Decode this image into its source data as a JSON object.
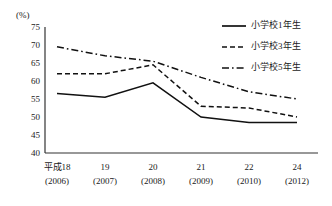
{
  "chart_data": {
    "type": "line",
    "title": "",
    "subtitle": "",
    "xlabel": "",
    "ylabel": "",
    "unit_label": "(%)",
    "ylim": [
      40,
      75
    ],
    "ytick_step": 5,
    "yticks": [
      "75",
      "70",
      "65",
      "60",
      "55",
      "50",
      "45",
      "40"
    ],
    "grid": false,
    "legend_position": "top-right",
    "categories": [
      "平成18",
      "19",
      "20",
      "21",
      "22",
      "24"
    ],
    "categories_sub": [
      "(2006)",
      "(2007)",
      "(2008)",
      "(2009)",
      "(2010)",
      "(2012)"
    ],
    "x": [
      2006,
      2007,
      2008,
      2009,
      2010,
      2012
    ],
    "series": [
      {
        "name": "小学校1年生",
        "style": "solid",
        "color": "#111111",
        "values": [
          56.5,
          55.5,
          59.5,
          50.0,
          48.5,
          48.5
        ]
      },
      {
        "name": "小学校3年生",
        "style": "dashed",
        "color": "#111111",
        "values": [
          62.0,
          62.0,
          64.5,
          53.0,
          52.5,
          50.0
        ]
      },
      {
        "name": "小学校5年生",
        "style": "dashdot",
        "color": "#111111",
        "values": [
          69.5,
          67.0,
          65.5,
          61.0,
          57.0,
          55.0
        ]
      }
    ]
  },
  "legend": {
    "items": [
      {
        "label": "小学校1年生",
        "style": "solid"
      },
      {
        "label": "小学校3年生",
        "style": "dashed"
      },
      {
        "label": "小学校5年生",
        "style": "dashdot"
      }
    ]
  }
}
